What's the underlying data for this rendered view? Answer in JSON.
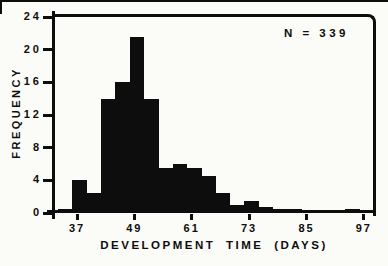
{
  "chart_data": {
    "type": "bar",
    "subtype": "histogram",
    "title": "",
    "xlabel": "DEVELOPMENT TIME (DAYS)",
    "ylabel": "FREQUENCY",
    "annotation": "N = 339",
    "sample_size": 339,
    "x_ticks": [
      37,
      49,
      61,
      73,
      85,
      97
    ],
    "y_ticks": [
      0,
      4,
      8,
      12,
      16,
      20,
      24
    ],
    "xlim": [
      32.2,
      98.5
    ],
    "ylim": [
      0,
      24
    ],
    "grid": "off",
    "bin_width_days": 3,
    "bin_starts": [
      33,
      36,
      39,
      42,
      45,
      48,
      51,
      54,
      57,
      60,
      63,
      66,
      69,
      72,
      75,
      78,
      81,
      84,
      87,
      90,
      93
    ],
    "frequencies": [
      0.5,
      4,
      2.5,
      14,
      16,
      21.5,
      14,
      5.5,
      6,
      5.5,
      4.5,
      2.5,
      1,
      1.5,
      0.8,
      0.5,
      0.5,
      0,
      0,
      0,
      0.5
    ],
    "colors": {
      "ink": "#0d0d0d",
      "paper": "#fbfbf8"
    }
  }
}
